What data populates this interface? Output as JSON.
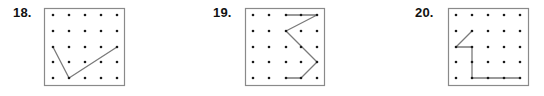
{
  "colors": {
    "border": "#8a8a8a",
    "dot": "#1a1a1a",
    "line": "#7a7a7a",
    "label": "#111111"
  },
  "grid": {
    "rows": 5,
    "cols": 5
  },
  "problems": [
    {
      "number": "18.",
      "label_x": 13,
      "box": {
        "x": 44,
        "y": 8,
        "w": 80,
        "h": 77
      },
      "dot_x": [
        53,
        69,
        85,
        101,
        117
      ],
      "dot_y": [
        15,
        31,
        47,
        62,
        78
      ],
      "path": [
        [
          0,
          2
        ],
        [
          1,
          4
        ],
        [
          4,
          2
        ]
      ]
    },
    {
      "number": "19.",
      "label_x": 213,
      "box": {
        "x": 245,
        "y": 8,
        "w": 79,
        "h": 77
      },
      "dot_x": [
        253,
        269,
        286,
        301,
        317
      ],
      "dot_y": [
        15,
        31,
        47,
        62,
        78
      ],
      "path": [
        [
          2,
          0
        ],
        [
          3,
          0
        ],
        [
          4,
          0
        ],
        [
          2,
          1
        ],
        [
          4,
          3
        ],
        [
          3,
          4
        ],
        [
          2,
          4
        ]
      ]
    },
    {
      "number": "20.",
      "label_x": 415,
      "box": {
        "x": 448,
        "y": 8,
        "w": 80,
        "h": 77
      },
      "dot_x": [
        456,
        472,
        488,
        504,
        520
      ],
      "dot_y": [
        15,
        31,
        47,
        62,
        78
      ],
      "path": [
        [
          1,
          1
        ],
        [
          0,
          2
        ],
        [
          1,
          2
        ],
        [
          1,
          4
        ],
        [
          2,
          4
        ],
        [
          3,
          4
        ],
        [
          4,
          4
        ]
      ]
    }
  ]
}
